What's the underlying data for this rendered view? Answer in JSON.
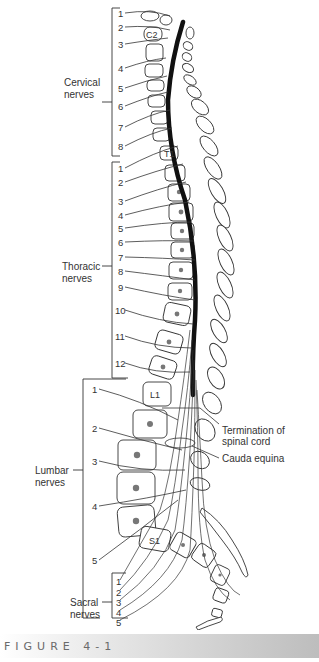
{
  "figure": {
    "caption": "FIGURE 4-1",
    "groups": [
      {
        "name": "Cervical",
        "label_line1": "Cervical",
        "label_line2": "nerves",
        "numbers": [
          "1",
          "2",
          "3",
          "4",
          "5",
          "6",
          "7",
          "8"
        ]
      },
      {
        "name": "Thoracic",
        "label_line1": "Thoracic",
        "label_line2": "nerves",
        "numbers": [
          "1",
          "2",
          "3",
          "4",
          "5",
          "6",
          "7",
          "8",
          "9",
          "10",
          "11",
          "12"
        ]
      },
      {
        "name": "Lumbar",
        "label_line1": "Lumbar",
        "label_line2": "nerves",
        "numbers": [
          "1",
          "2",
          "3",
          "4",
          "5"
        ]
      },
      {
        "name": "Sacral",
        "label_line1": "Sacral",
        "label_line2": "nerves",
        "numbers": [
          "1",
          "2",
          "3",
          "4",
          "5"
        ]
      }
    ],
    "vertebra_labels": {
      "c2": "C2",
      "t1": "T1",
      "l1": "L1",
      "s1": "S1"
    },
    "annotations": {
      "termination_line1": "Termination of",
      "termination_line2": "spinal cord",
      "cauda_equina": "Cauda equina"
    }
  }
}
